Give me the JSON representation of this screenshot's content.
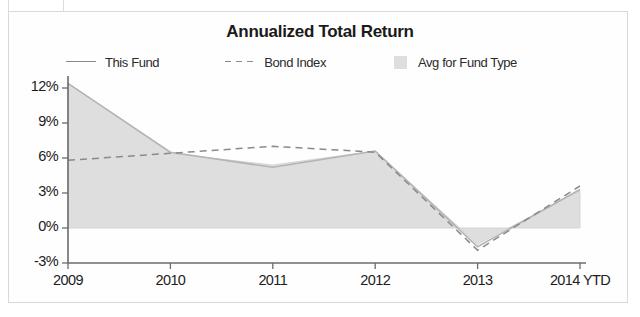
{
  "chart_data": {
    "type": "area",
    "title": "Annualized Total Return",
    "xlabel": "",
    "ylabel": "",
    "categories": [
      "2009",
      "2010",
      "2011",
      "2012",
      "2013",
      "2014 YTD"
    ],
    "x_tick_labels": [
      "2009",
      "2010",
      "2011",
      "2012",
      "2013",
      "2014 YTD"
    ],
    "y_tick_labels": [
      "12%",
      "9%",
      "6%",
      "3%",
      "0%",
      "-3%"
    ],
    "y_tick_values": [
      12,
      9,
      6,
      3,
      0,
      -3
    ],
    "ylim": [
      -3,
      12.6
    ],
    "grid": false,
    "legend_position": "top",
    "series": [
      {
        "name": "This Fund",
        "style": "line-solid",
        "color": "#b4b4b4",
        "values": [
          12.4,
          6.5,
          5.2,
          6.6,
          -1.6,
          3.3
        ]
      },
      {
        "name": "Bond Index",
        "style": "line-dashed",
        "color": "#8a8a8a",
        "values": [
          5.8,
          6.4,
          7.0,
          6.5,
          -1.9,
          3.6
        ]
      },
      {
        "name": "Avg for Fund Type",
        "style": "area-filled",
        "color": "#dedede",
        "values": [
          12.4,
          6.4,
          5.4,
          6.6,
          -1.4,
          3.2
        ]
      }
    ]
  },
  "legend": {
    "items": [
      {
        "label": "This Fund",
        "marker": "solid-line-swatch"
      },
      {
        "label": "Bond Index",
        "marker": "dashed-line-swatch"
      },
      {
        "label": "Avg for Fund Type",
        "marker": "filled-square-swatch"
      }
    ]
  },
  "axes": {
    "y_labels": [
      "12%",
      "9%",
      "6%",
      "3%",
      "0%",
      "-3%"
    ],
    "x_labels": [
      "2009",
      "2010",
      "2011",
      "2012",
      "2013",
      "2014 YTD"
    ]
  }
}
